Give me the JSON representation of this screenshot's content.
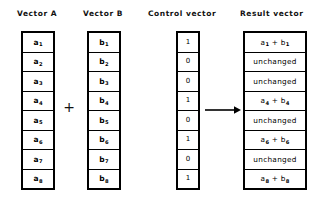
{
  "diagram": {
    "title_columns": {
      "vector_a": "Vector A",
      "vector_b": "Vector B",
      "control": "Control vector",
      "result": "Result vector"
    },
    "operator": {
      "plus": "+",
      "arrow": "arrow-right"
    },
    "columns": {
      "vector_a": {
        "label": "Vector A",
        "cells": [
          {
            "base": "a",
            "sub": "1"
          },
          {
            "base": "a",
            "sub": "2"
          },
          {
            "base": "a",
            "sub": "3"
          },
          {
            "base": "a",
            "sub": "4"
          },
          {
            "base": "a",
            "sub": "5"
          },
          {
            "base": "a",
            "sub": "6"
          },
          {
            "base": "a",
            "sub": "7"
          },
          {
            "base": "a",
            "sub": "8"
          }
        ]
      },
      "vector_b": {
        "label": "Vector B",
        "cells": [
          {
            "base": "b",
            "sub": "1"
          },
          {
            "base": "b",
            "sub": "2"
          },
          {
            "base": "b",
            "sub": "3"
          },
          {
            "base": "b",
            "sub": "4"
          },
          {
            "base": "b",
            "sub": "5"
          },
          {
            "base": "b",
            "sub": "6"
          },
          {
            "base": "b",
            "sub": "7"
          },
          {
            "base": "b",
            "sub": "8"
          }
        ]
      },
      "control": {
        "label": "Control vector",
        "cells": [
          "1",
          "0",
          "0",
          "1",
          "0",
          "1",
          "0",
          "1"
        ]
      },
      "result": {
        "label": "Result vector",
        "cells": [
          {
            "type": "sum",
            "text": "a1 + b1",
            "a_sub": "1",
            "b_sub": "1"
          },
          {
            "type": "word",
            "text": "unchanged"
          },
          {
            "type": "word",
            "text": "unchanged"
          },
          {
            "type": "sum",
            "text": "a4 + b4",
            "a_sub": "4",
            "b_sub": "4"
          },
          {
            "type": "word",
            "text": "unchanged"
          },
          {
            "type": "sum",
            "text": "a6 + b6",
            "a_sub": "6",
            "b_sub": "6"
          },
          {
            "type": "word",
            "text": "unchanged"
          },
          {
            "type": "sum",
            "text": "a8 + b8",
            "a_sub": "8",
            "b_sub": "8"
          }
        ]
      }
    },
    "colors": {
      "background": "#ffffff",
      "ink": "#000000",
      "border": "#000000"
    }
  }
}
